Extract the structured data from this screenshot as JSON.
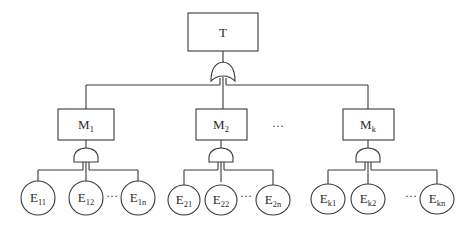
{
  "diagram": {
    "type": "fault-tree",
    "top_event": {
      "label": "T",
      "gate": "OR"
    },
    "ellipsis_between_modules": "…",
    "modules": [
      {
        "main": "M",
        "sub": "1",
        "gate": "AND",
        "events": [
          {
            "main": "E",
            "sub": "11"
          },
          {
            "main": "E",
            "sub": "12"
          },
          {
            "main": "E",
            "sub": "1n"
          }
        ],
        "ellipsis": "…"
      },
      {
        "main": "M",
        "sub": "2",
        "gate": "AND",
        "events": [
          {
            "main": "E",
            "sub": "21"
          },
          {
            "main": "E",
            "sub": "22"
          },
          {
            "main": "E",
            "sub": "2n"
          }
        ],
        "ellipsis": "…"
      },
      {
        "main": "M",
        "sub": "k",
        "gate": "AND",
        "events": [
          {
            "main": "E",
            "sub": "k1"
          },
          {
            "main": "E",
            "sub": "k2"
          },
          {
            "main": "E",
            "sub": "kn"
          }
        ],
        "ellipsis": "…"
      }
    ]
  }
}
